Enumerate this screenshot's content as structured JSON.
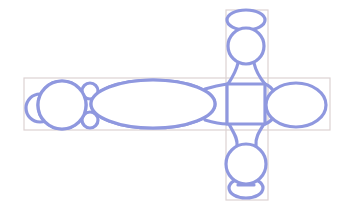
{
  "diagram": {
    "colors": {
      "shape_stroke": "#8f98df",
      "frame_stroke": "#ddd2d2",
      "background": "#ffffff"
    },
    "frames": [
      {
        "name": "horizontal-bar-frame",
        "x": 24,
        "y": 78,
        "w": 306,
        "h": 52
      },
      {
        "name": "vertical-bar-frame",
        "x": 226,
        "y": 10,
        "w": 42,
        "h": 190
      }
    ],
    "square": {
      "name": "center-square",
      "x": 227,
      "y": 84,
      "w": 38,
      "h": 40
    },
    "circles": [
      {
        "name": "left-end-half-circle",
        "cx": 40,
        "cy": 108,
        "r": 14
      },
      {
        "name": "left-large-circle",
        "cx": 62,
        "cy": 105,
        "r": 24
      },
      {
        "name": "left-connector-top-circle",
        "cx": 90,
        "cy": 91,
        "r": 8
      },
      {
        "name": "left-connector-bottom-circle",
        "cx": 90,
        "cy": 120,
        "r": 8
      },
      {
        "name": "top-circle",
        "cx": 246,
        "cy": 46,
        "r": 18
      },
      {
        "name": "bottom-circle",
        "cx": 246,
        "cy": 164,
        "r": 20
      }
    ],
    "ellipses": [
      {
        "name": "central-long-ellipse",
        "cx": 153,
        "cy": 104,
        "rx": 62,
        "ry": 24
      },
      {
        "name": "right-ellipse",
        "cx": 296,
        "cy": 105,
        "rx": 30,
        "ry": 22
      },
      {
        "name": "top-oval",
        "cx": 246,
        "cy": 20,
        "rx": 19,
        "ry": 10
      },
      {
        "name": "bottom-oval",
        "cx": 246,
        "cy": 188,
        "rx": 17,
        "ry": 10
      }
    ],
    "connectors": [
      {
        "name": "top-neck-left",
        "d": "M238 63 C236 72 232 78 228 84"
      },
      {
        "name": "top-neck-right",
        "d": "M254 63 C256 72 260 78 265 84"
      },
      {
        "name": "bottom-neck-left",
        "d": "M229 124 C233 132 238 138 237 146"
      },
      {
        "name": "bottom-neck-right",
        "d": "M264 124 C259 132 255 138 256 146"
      },
      {
        "name": "ellipse-to-square-top",
        "d": "M205 89 C215 86 220 85 227 84"
      },
      {
        "name": "ellipse-to-square-bottom",
        "d": "M205 120 C215 123 220 124 227 124"
      },
      {
        "name": "square-to-right-ellipse-top",
        "d": "M265 84 C270 86 272 88 274 92"
      },
      {
        "name": "square-to-right-ellipse-bottom",
        "d": "M265 124 C270 122 272 120 274 117"
      },
      {
        "name": "bottom-oval-mark",
        "d": "M238 186 L254 186"
      }
    ]
  }
}
